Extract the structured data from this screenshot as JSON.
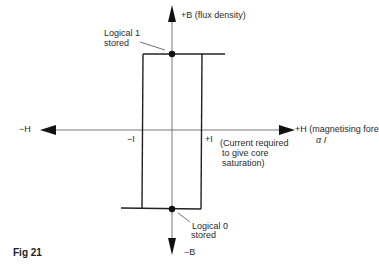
{
  "figure": {
    "caption": "Fig 21"
  },
  "axes": {
    "y_positive": "+B (flux density)",
    "y_negative": "−B",
    "x_positive": "+H (magnetising fore",
    "x_positive_line2": "α I",
    "x_negative": "−H",
    "tick_neg": "−I",
    "tick_pos": "+I"
  },
  "annotations": {
    "logical1_line1": "Logical 1",
    "logical1_line2": "stored",
    "logical0_line1": "Logical 0",
    "logical0_line2": "stored",
    "current_line1": "(Current required",
    "current_line2": "to give core",
    "current_line3": "saturation)"
  },
  "colors": {
    "line": "#222222",
    "axis": "#444444"
  }
}
